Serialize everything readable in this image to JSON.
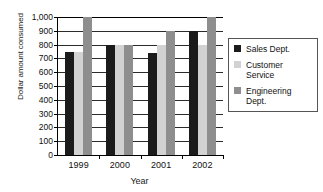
{
  "chart_data": {
    "type": "bar",
    "title": "",
    "xlabel": "Year",
    "ylabel": "Dollar amount consumed",
    "categories": [
      "1999",
      "2000",
      "2001",
      "2002"
    ],
    "series": [
      {
        "name": "Sales Dept.",
        "color": "#1b1b1b",
        "values": [
          750,
          800,
          740,
          900
        ]
      },
      {
        "name": "Customer Service",
        "color": "#d2d2d2",
        "values": [
          750,
          800,
          800,
          800
        ]
      },
      {
        "name": "Engineering Dept.",
        "color": "#8e8e8e",
        "values": [
          1000,
          800,
          900,
          1000
        ]
      }
    ],
    "ylim": [
      0,
      1000
    ],
    "ytick_values": [
      0,
      100,
      200,
      300,
      400,
      500,
      600,
      700,
      800,
      900,
      1000
    ],
    "ytick_labels": [
      "0",
      "100",
      "200",
      "300",
      "400",
      "500",
      "600",
      "700",
      "800",
      "900",
      "1,000"
    ],
    "grid": true,
    "legend_position": "right",
    "legend_entries": [
      {
        "label": "Sales Dept.",
        "swatch": "#1b1b1b"
      },
      {
        "label": "Customer Service",
        "swatch": "#d2d2d2"
      },
      {
        "label": "Engineering Dept.",
        "swatch": "#8e8e8e"
      }
    ]
  }
}
